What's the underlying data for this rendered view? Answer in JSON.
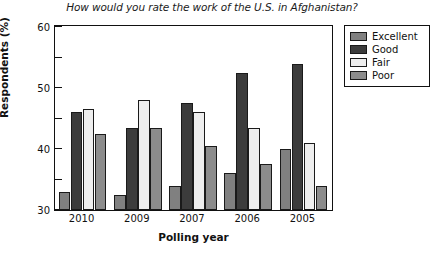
{
  "chart_data": {
    "type": "bar",
    "title": "How would you rate the work of the U.S. in Afghanistan?",
    "xlabel": "Polling year",
    "ylabel": "Respondents (%)",
    "categories": [
      "2010",
      "2009",
      "2007",
      "2006",
      "2005"
    ],
    "ylim": [
      0,
      60
    ],
    "yticks": [
      0,
      10,
      20,
      30,
      40,
      50,
      60
    ],
    "grid": false,
    "legend_position": "right-outside",
    "series": [
      {
        "name": "Excellent",
        "color": "#808080",
        "values": [
          6,
          5,
          8,
          12,
          20
        ]
      },
      {
        "name": "Good",
        "color": "#3c3c3c",
        "values": [
          32,
          27,
          35,
          45,
          48
        ]
      },
      {
        "name": "Fair",
        "color": "#eeeeee",
        "values": [
          33,
          36,
          32,
          27,
          22
        ]
      },
      {
        "name": "Poor",
        "color": "#8c8c8c",
        "values": [
          25,
          27,
          21,
          15,
          8
        ]
      }
    ]
  }
}
